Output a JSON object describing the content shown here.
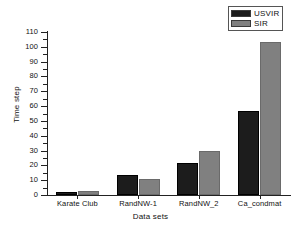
{
  "chart_data": {
    "type": "bar",
    "title": "",
    "xlabel": "Data sets",
    "ylabel": "Time step",
    "categories": [
      "Karate Club",
      "RandNW-1",
      "RandNW_2",
      "Ca_condmat"
    ],
    "series": [
      {
        "name": "USVIR",
        "color": "#1c1c1c",
        "values": [
          2,
          13.5,
          21.5,
          57
        ]
      },
      {
        "name": "SIR",
        "color": "#808080",
        "values": [
          3,
          10.5,
          30,
          103
        ]
      }
    ],
    "ylim": [
      0,
      110
    ],
    "ytick_values": [
      0,
      10,
      20,
      30,
      40,
      50,
      60,
      70,
      80,
      90,
      100,
      110
    ],
    "ytick_labels": [
      "0",
      "10",
      "20",
      "30",
      "40",
      "50",
      "60",
      "70",
      "80",
      "90",
      "100",
      "110"
    ],
    "minor_ticks": true,
    "grid": false,
    "legend_position": "top-right",
    "legend_entries": [
      "USVIR",
      "SIR"
    ]
  },
  "legend": {
    "items": [
      {
        "label": "USVIR"
      },
      {
        "label": "SIR"
      }
    ]
  },
  "axes": {
    "x_title": "Data sets",
    "y_title": "Time step"
  }
}
